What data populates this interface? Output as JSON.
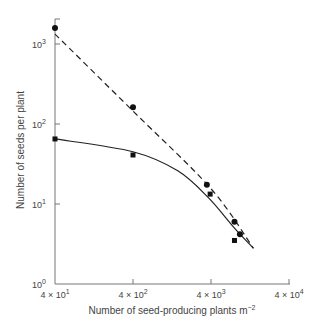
{
  "chart_data": {
    "type": "scatter",
    "title": "",
    "xlabel": "Number of seed-producing plants m⁻²",
    "ylabel": "Number of seeds per plant",
    "xscale": "log",
    "yscale": "log",
    "xlim": [
      40,
      40000
    ],
    "ylim": [
      1,
      2000
    ],
    "grid": false,
    "legend": "none",
    "x_ticks": [
      {
        "value": 40,
        "label_base": "4 × 10",
        "exp": "1"
      },
      {
        "value": 400,
        "label_base": "4 × 10",
        "exp": "2"
      },
      {
        "value": 4000,
        "label_base": "4 × 10",
        "exp": "3"
      },
      {
        "value": 40000,
        "label_base": "4 × 10",
        "exp": "4"
      }
    ],
    "y_ticks": [
      {
        "value": 1,
        "label_base": "10",
        "exp": "0"
      },
      {
        "value": 10,
        "label_base": "10",
        "exp": "1"
      },
      {
        "value": 100,
        "label_base": "10",
        "exp": "2"
      },
      {
        "value": 1000,
        "label_base": "10",
        "exp": "3"
      }
    ],
    "series": [
      {
        "name": "circles",
        "marker": "circle",
        "line": "dashed",
        "points": [
          {
            "x": 40,
            "y": 1585
          },
          {
            "x": 400,
            "y": 162
          },
          {
            "x": 3540,
            "y": 17.4
          },
          {
            "x": 8000,
            "y": 6.0
          },
          {
            "x": 9400,
            "y": 4.2
          }
        ],
        "fit_line": [
          {
            "x": 40,
            "y": 1330
          },
          {
            "x": 400,
            "y": 145
          },
          {
            "x": 4000,
            "y": 15.5
          },
          {
            "x": 14000,
            "y": 2.8
          }
        ]
      },
      {
        "name": "squares",
        "marker": "square",
        "line": "solid",
        "points": [
          {
            "x": 40,
            "y": 65
          },
          {
            "x": 400,
            "y": 41
          },
          {
            "x": 3900,
            "y": 13.3
          },
          {
            "x": 8000,
            "y": 3.5
          }
        ],
        "fit_line": [
          {
            "x": 40,
            "y": 65
          },
          {
            "x": 400,
            "y": 45
          },
          {
            "x": 1500,
            "y": 26
          },
          {
            "x": 3700,
            "y": 12
          },
          {
            "x": 8000,
            "y": 5
          },
          {
            "x": 14000,
            "y": 2.8
          }
        ]
      }
    ]
  }
}
